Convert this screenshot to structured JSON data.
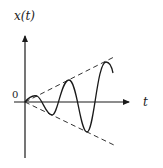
{
  "diagram": {
    "type": "growing-oscillation",
    "y_axis_label": "x(t)",
    "x_axis_label": "t",
    "origin_label": "0",
    "envelope_style": "dashed",
    "colors": {
      "axis": "#1a1a1a",
      "curve": "#1a1a1a",
      "envelope": "#333333",
      "background": "#ffffff"
    }
  }
}
